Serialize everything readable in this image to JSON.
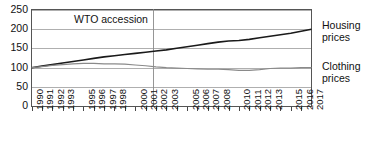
{
  "chart_data": {
    "type": "line",
    "title": "",
    "subtitle": "",
    "xlabel": "",
    "ylabel": "",
    "index_base": "1990 = 100",
    "grid": true,
    "grid_axis": "y",
    "legend_position": "right",
    "xlim": [
      1990,
      2017
    ],
    "ylim": [
      0,
      250
    ],
    "yticks": [
      0,
      50,
      100,
      150,
      200,
      250
    ],
    "x": [
      1990,
      1991,
      1992,
      1993,
      1994,
      1995,
      1996,
      1997,
      1998,
      1999,
      2000,
      2001,
      2002,
      2003,
      2004,
      2005,
      2006,
      2007,
      2008,
      2009,
      2010,
      2011,
      2012,
      2013,
      2014,
      2015,
      2016,
      2017
    ],
    "xtick_labels": [
      "1990",
      "1991",
      "1992",
      "1993",
      "",
      "1995",
      "1996",
      "1997",
      "1998",
      "",
      "2000",
      "2001",
      "2002",
      "2003",
      "",
      "2005",
      "2006",
      "2007",
      "2008",
      "",
      "2010",
      "2011",
      "2012",
      "2013",
      "",
      "2015",
      "2016",
      "2017"
    ],
    "series": [
      {
        "name": "Housing prices",
        "color": "#1a1a1a",
        "width": 1.6,
        "values": [
          100,
          104,
          108,
          112,
          116,
          120,
          124,
          128,
          131,
          134,
          137,
          140,
          143,
          146,
          150,
          154,
          158,
          162,
          166,
          169,
          170,
          173,
          177,
          181,
          185,
          189,
          194,
          199
        ]
      },
      {
        "name": "Clothing prices",
        "color": "#8a8a8a",
        "width": 1.2,
        "values": [
          100,
          103,
          106,
          108,
          110,
          111,
          111,
          110,
          110,
          109,
          107,
          105,
          102,
          100,
          99,
          98,
          97,
          96,
          96,
          95,
          93,
          93,
          95,
          98,
          99,
          99,
          100,
          100
        ]
      }
    ],
    "annotations": [
      {
        "name": "wto-accession",
        "text": "WTO accession",
        "x": 2001.7,
        "type": "vline-with-label",
        "line_color": "#8a8a8a"
      }
    ]
  },
  "axis": {
    "y_labels": [
      "250",
      "200",
      "150",
      "100",
      "50",
      "0"
    ],
    "x_labels": [
      "1990",
      "1991",
      "1992",
      "1993",
      "1995",
      "1996",
      "1997",
      "1998",
      "2000",
      "2001",
      "2002",
      "2003",
      "2005",
      "2006",
      "2007",
      "2008",
      "2010",
      "2011",
      "2012",
      "2013",
      "2015",
      "2016",
      "2017"
    ]
  },
  "legend": {
    "housing": {
      "line1": "Housing",
      "line2": "prices"
    },
    "clothing": {
      "line1": "Clothing",
      "line2": "prices"
    }
  },
  "annotation": {
    "wto_label": "WTO accession"
  }
}
